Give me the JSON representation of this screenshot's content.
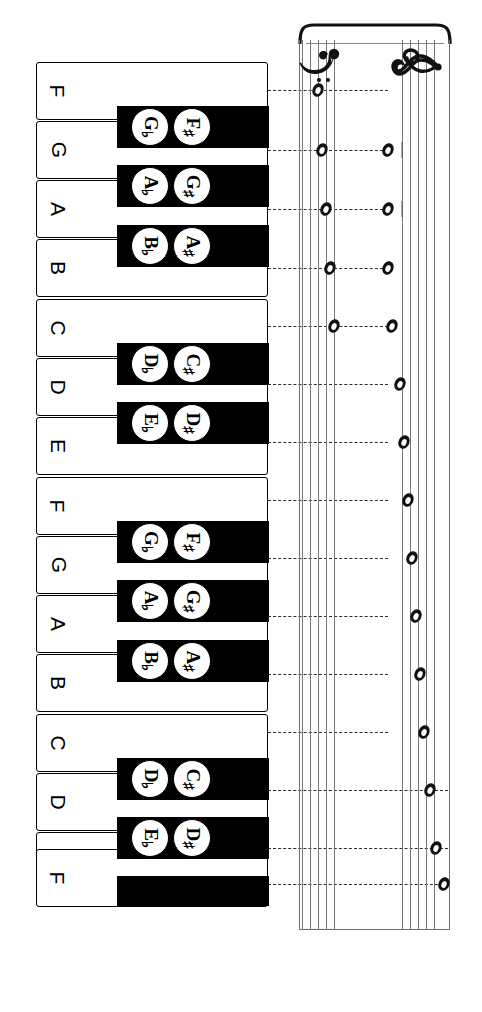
{
  "diagram": {
    "orientation": "rotated-90",
    "colors": {
      "ink": "#000000",
      "staff": "#777777",
      "paper": "#ffffff",
      "dash": "#2b2b2b"
    }
  },
  "keyboard": {
    "white_keys": [
      {
        "label": "F",
        "top": 0,
        "height": 58
      },
      {
        "label": "G",
        "top": 59,
        "height": 58
      },
      {
        "label": "A",
        "top": 118,
        "height": 58
      },
      {
        "label": "B",
        "top": 177,
        "height": 58
      },
      {
        "label": "C",
        "top": 237,
        "height": 58
      },
      {
        "label": "D",
        "top": 296,
        "height": 58
      },
      {
        "label": "E",
        "top": 355,
        "height": 58
      },
      {
        "label": "F",
        "top": 415,
        "height": 58
      },
      {
        "label": "G",
        "top": 474,
        "height": 58
      },
      {
        "label": "A",
        "top": 533,
        "height": 58
      },
      {
        "label": "B",
        "top": 592,
        "height": 58
      },
      {
        "label": "C",
        "top": 652,
        "height": 58
      },
      {
        "label": "D",
        "top": 711,
        "height": 58
      },
      {
        "label": "E",
        "top": 770,
        "height": 58
      },
      {
        "label": "F",
        "top": 787,
        "height": 58
      }
    ],
    "black_keys": [
      {
        "flat": "G",
        "sharp": "F",
        "top": 44,
        "labeled": true
      },
      {
        "flat": "A",
        "sharp": "G",
        "top": 103,
        "labeled": true
      },
      {
        "flat": "B",
        "sharp": "A",
        "top": 163,
        "labeled": true
      },
      {
        "flat": "D",
        "sharp": "C",
        "top": 281,
        "labeled": true
      },
      {
        "flat": "E",
        "sharp": "D",
        "top": 340,
        "labeled": true
      },
      {
        "flat": "G",
        "sharp": "F",
        "top": 459,
        "labeled": true
      },
      {
        "flat": "A",
        "sharp": "G",
        "top": 518,
        "labeled": true
      },
      {
        "flat": "B",
        "sharp": "A",
        "top": 578,
        "labeled": true
      },
      {
        "flat": "D",
        "sharp": "C",
        "top": 696,
        "labeled": true
      },
      {
        "flat": "E",
        "sharp": "D",
        "top": 755,
        "labeled": true
      },
      {
        "flat": "",
        "sharp": "",
        "top": 814,
        "labeled": false
      }
    ],
    "flat_symbol": "♭",
    "sharp_symbol": "♯"
  },
  "staff": {
    "clefs": [
      {
        "name": "bass-clef",
        "symbol": "F-clef"
      },
      {
        "name": "treble-clef",
        "symbol": "G-clef"
      }
    ],
    "bass_lines_x": [
      6,
      14,
      22,
      30,
      38
    ],
    "treble_lines_x": [
      106,
      114,
      122,
      130,
      138
    ],
    "notes": [
      {
        "staff": "bass",
        "x": 22,
        "y": 68,
        "ledger": false,
        "pitch": "F"
      },
      {
        "staff": "bass",
        "x": 26,
        "y": 128,
        "ledger": false,
        "pitch": "G"
      },
      {
        "staff": "bass",
        "x": 30,
        "y": 187,
        "ledger": false,
        "pitch": "A"
      },
      {
        "staff": "bass",
        "x": 34,
        "y": 246,
        "ledger": false,
        "pitch": "B"
      },
      {
        "staff": "bass",
        "x": 38,
        "y": 304,
        "ledger": false,
        "pitch": "C"
      },
      {
        "staff": "treble",
        "x": 92,
        "y": 128,
        "ledger": true,
        "pitch": "G"
      },
      {
        "staff": "treble",
        "x": 92,
        "y": 187,
        "ledger": true,
        "pitch": "A"
      },
      {
        "staff": "treble",
        "x": 92,
        "y": 246,
        "ledger": false,
        "pitch": "B"
      },
      {
        "staff": "treble",
        "x": 96,
        "y": 304,
        "ledger": false,
        "pitch": "C"
      },
      {
        "staff": "treble",
        "x": 104,
        "y": 362,
        "ledger": false,
        "pitch": "D"
      },
      {
        "staff": "treble",
        "x": 108,
        "y": 420,
        "ledger": false,
        "pitch": "E"
      },
      {
        "staff": "treble",
        "x": 112,
        "y": 478,
        "ledger": false,
        "pitch": "F"
      },
      {
        "staff": "treble",
        "x": 116,
        "y": 536,
        "ledger": false,
        "pitch": "G"
      },
      {
        "staff": "treble",
        "x": 120,
        "y": 594,
        "ledger": false,
        "pitch": "A"
      },
      {
        "staff": "treble",
        "x": 124,
        "y": 652,
        "ledger": false,
        "pitch": "B"
      },
      {
        "staff": "treble",
        "x": 128,
        "y": 710,
        "ledger": false,
        "pitch": "C"
      },
      {
        "staff": "treble",
        "x": 134,
        "y": 768,
        "ledger": false,
        "pitch": "D"
      },
      {
        "staff": "treble",
        "x": 140,
        "y": 826,
        "ledger": false,
        "pitch": "E"
      },
      {
        "staff": "treble",
        "x": 148,
        "y": 862,
        "ledger": false,
        "pitch": "F"
      }
    ]
  },
  "connectors_y": [
    90,
    150,
    209,
    268,
    326,
    384,
    442,
    500,
    558,
    616,
    674,
    732,
    790,
    848,
    884
  ]
}
